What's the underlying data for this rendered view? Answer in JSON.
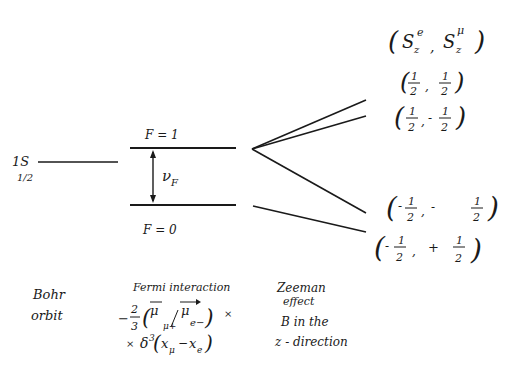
{
  "diagram": {
    "levels": {
      "bohr": {
        "label_main": "1S",
        "label_sub": "1/2"
      },
      "f1": {
        "label": "F = 1"
      },
      "f0": {
        "label": "F = 0"
      },
      "splitting": {
        "label": "ν",
        "sub": "F"
      }
    },
    "zeeman_states": {
      "header": {
        "open": "(",
        "s1": "S",
        "s1_sub": "z",
        "s1_sup": "e",
        "comma": ",",
        "s2": "S",
        "s2_sub": "z",
        "s2_sup": "μ",
        "close": ")"
      },
      "states": [
        {
          "se": "1/2",
          "smu": "1/2",
          "se_sign": "",
          "smu_sign": ""
        },
        {
          "se": "1/2",
          "smu": "1/2",
          "se_sign": "",
          "smu_sign": "-"
        },
        {
          "se": "1/2",
          "smu": "1/2",
          "se_sign": "-",
          "smu_sign": "-"
        },
        {
          "se": "1/2",
          "smu": "1/2",
          "se_sign": "-",
          "smu_sign": "+"
        }
      ]
    },
    "captions": {
      "bohr_line1": "Bohr",
      "bohr_line2": "orbit",
      "fermi_title": "Fermi interaction",
      "fermi_formula_line1": "−(2/3)(μ⃗μ+ · μ⃗e−) ×",
      "fermi_formula_line2": "× δ³(xμ − xe)",
      "zeeman_line1": "Zeeman",
      "zeeman_line2": "effect",
      "zeeman_line3": "B in the",
      "zeeman_line4": "z - direction"
    }
  }
}
